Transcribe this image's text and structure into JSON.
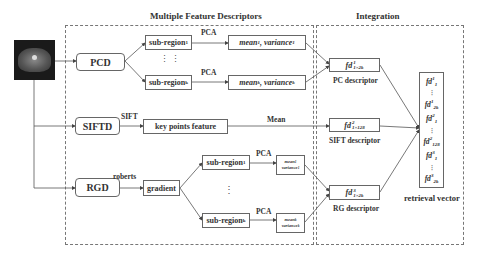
{
  "titles": {
    "left": "Multiple Feature Descriptors",
    "right": "Integration"
  },
  "input_image": {
    "icon": "ct-scan-image"
  },
  "pcd": {
    "label": "PCD",
    "subregion_1": "sub-region",
    "subregion_1_idx": "1",
    "subregion_k": "sub-region",
    "subregion_k_idx": "k",
    "pca_1": "PCA",
    "pca_k": "PCA",
    "mean_1": "mean",
    "mean_1_idx": "1",
    "variance_1": ", variance",
    "variance_1_idx": "1",
    "mean_k": "mean",
    "mean_k_idx": "k",
    "variance_k": ", variance",
    "variance_k_idx": "k",
    "ellipsis": "⋮ ⋮"
  },
  "siftd": {
    "label": "SIFTD",
    "edge_label": "SIFT",
    "feature": "key points feature",
    "mean_label": "Mean"
  },
  "rgd": {
    "label": "RGD",
    "edge_label": "roberts",
    "gradient": "gradient",
    "subregion_1": "sub-region",
    "subregion_1_idx": "1",
    "subregion_k": "sub-region",
    "subregion_k_idx": "k",
    "pca_1": "PCA",
    "pca_k": "PCA",
    "mean_1": "mean",
    "mean_1_idx": "1",
    "variance_1": "variance",
    "variance_1_idx": "1",
    "mean_k": "mean",
    "mean_k_idx": "k",
    "variance_k": "variance",
    "variance_k_idx": "k",
    "ellipsis": "⋮"
  },
  "integration": {
    "pc": {
      "fd": "fd",
      "sup": "1",
      "sub": "1×2k",
      "caption": "PC descriptor"
    },
    "sift": {
      "fd": "fd",
      "sup": "2",
      "sub": "1×128",
      "caption": "SIFT descriptor"
    },
    "rg": {
      "fd": "fd",
      "sup": "3",
      "sub": "1×2k",
      "caption": "RG descriptor"
    },
    "retrieval": {
      "caption": "retrieval vector",
      "entries": [
        {
          "fd": "fd",
          "sup": "1",
          "sub": "1"
        },
        {
          "fd": "fd",
          "sup": "1",
          "sub": "2k"
        },
        {
          "fd": "fd",
          "sup": "2",
          "sub": "1"
        },
        {
          "fd": "fd",
          "sup": "2",
          "sub": "128"
        },
        {
          "fd": "fd",
          "sup": "3",
          "sub": "1"
        },
        {
          "fd": "fd",
          "sup": "3",
          "sub": "2k"
        }
      ]
    }
  }
}
